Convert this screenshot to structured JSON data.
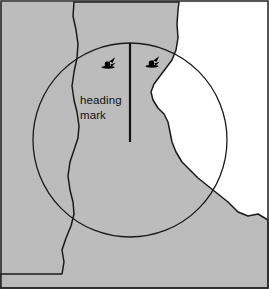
{
  "figure": {
    "caption_lines": [
      "heading",
      "mark"
    ],
    "colors": {
      "land_fill": "#bcbcbc",
      "water_fill": "#ffffff",
      "outline": "#1a1a1a",
      "border": "#2b2b2b",
      "vessel_symbol": "#000000",
      "text": "#111111"
    },
    "labels": {
      "heading": "heading",
      "mark": "mark"
    },
    "range_ring": {
      "center_x": 130,
      "center_y": 140,
      "radius": 97,
      "stroke_width": 1.3
    },
    "heading_mark_line": {
      "x": 130,
      "y_top": 43,
      "y_bottom": 142,
      "stroke_width": 2.2
    },
    "vessel_symbols": [
      {
        "name": "vessel-target-left",
        "x": 108,
        "y": 64
      },
      {
        "name": "vessel-target-right",
        "x": 152,
        "y": 63
      }
    ],
    "frame": {
      "x": 1,
      "y": 1,
      "width": 267,
      "height": 287,
      "stroke_width": 1.6
    },
    "landmass_left_path": "M 0,288 L 0,274 L 62,274 L 64,262 L 62,250 L 66,238 L 71,226 L 74,214 L 73,202 L 70,190 L 68,176 L 70,162 L 74,150 L 78,138 L 79,126 L 77,112 L 74,100 L 72,86 L 74,72 L 77,58 L 78,44 L 76,30 L 73,16 L 74,2 L 0,2 Z",
    "landmass_channel_path": "M 74,2 L 73,16 L 76,30 L 78,44 L 77,58 L 74,72 L 72,86 L 74,100 L 77,112 L 79,126 L 78,138 L 74,150 L 70,162 L 68,176 L 70,190 L 73,202 L 74,214 L 71,226 L 66,238 L 62,250 L 64,262 L 62,274 L 0,274 L 0,288 L 268,288 L 268,220 L 258,214 L 248,216 L 238,212 L 228,202 L 218,194 L 208,186 L 198,178 L 190,170 L 182,162 L 176,152 L 172,142 L 170,132 L 168,122 L 164,114 L 158,108 L 153,100 L 151,92 L 154,84 L 160,76 L 166,68 L 172,60 L 176,50 L 178,38 L 177,24 L 178,10 L 179,2 Z",
    "annotations": {
      "symbol_kind": "vessel-target-icon",
      "symbol_count": 2
    }
  }
}
